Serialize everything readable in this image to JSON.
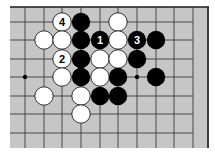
{
  "diagram": {
    "type": "go-board-fragment",
    "board_color": "#c6c6c6",
    "line_color": "#3a3a3a",
    "edge_color": "#1a1a1a",
    "black_color": "#000000",
    "white_color": "#ffffff",
    "columns_x": [
      25,
      44,
      62,
      81,
      100,
      118,
      137,
      156,
      174,
      193
    ],
    "rows_y": [
      22,
      40,
      59,
      77,
      96,
      114,
      133
    ],
    "board_rect": {
      "x": 10,
      "y": 7,
      "w": 199,
      "h": 141
    },
    "top_edge": true,
    "right_edge": true,
    "hoshi": [
      {
        "col": 0,
        "row": 3
      },
      {
        "col": 6,
        "row": 3
      }
    ],
    "stone_radius": 9.2,
    "stones": [
      {
        "col": 2,
        "row": 0,
        "color": "white",
        "label": "4"
      },
      {
        "col": 3,
        "row": 0,
        "color": "black",
        "label": ""
      },
      {
        "col": 5,
        "row": 0,
        "color": "white",
        "label": ""
      },
      {
        "col": 1,
        "row": 1,
        "color": "white",
        "label": ""
      },
      {
        "col": 2,
        "row": 1,
        "color": "white",
        "label": ""
      },
      {
        "col": 3,
        "row": 1,
        "color": "black",
        "label": ""
      },
      {
        "col": 4,
        "row": 1,
        "color": "black",
        "label": "1"
      },
      {
        "col": 5,
        "row": 1,
        "color": "white",
        "label": ""
      },
      {
        "col": 6,
        "row": 1,
        "color": "black",
        "label": "3"
      },
      {
        "col": 7,
        "row": 1,
        "color": "black",
        "label": ""
      },
      {
        "col": 2,
        "row": 2,
        "color": "white",
        "label": "2"
      },
      {
        "col": 3,
        "row": 2,
        "color": "black",
        "label": ""
      },
      {
        "col": 4,
        "row": 2,
        "color": "white",
        "label": ""
      },
      {
        "col": 5,
        "row": 2,
        "color": "white",
        "label": ""
      },
      {
        "col": 6,
        "row": 2,
        "color": "black",
        "label": ""
      },
      {
        "col": 2,
        "row": 3,
        "color": "white",
        "label": ""
      },
      {
        "col": 3,
        "row": 3,
        "color": "black",
        "label": ""
      },
      {
        "col": 4,
        "row": 3,
        "color": "white",
        "label": ""
      },
      {
        "col": 5,
        "row": 3,
        "color": "black",
        "label": ""
      },
      {
        "col": 7,
        "row": 3,
        "color": "black",
        "label": ""
      },
      {
        "col": 1,
        "row": 4,
        "color": "white",
        "label": ""
      },
      {
        "col": 3,
        "row": 4,
        "color": "white",
        "label": ""
      },
      {
        "col": 4,
        "row": 4,
        "color": "black",
        "label": ""
      },
      {
        "col": 5,
        "row": 4,
        "color": "black",
        "label": ""
      },
      {
        "col": 3,
        "row": 5,
        "color": "white",
        "label": ""
      }
    ]
  }
}
